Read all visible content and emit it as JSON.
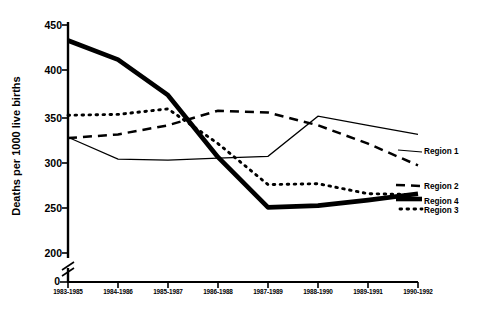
{
  "chart_data": {
    "type": "line",
    "title": "",
    "xlabel": "",
    "ylabel": "Deaths per 1000 live births",
    "categories": [
      "1983-1985",
      "1984-1986",
      "1985-1987",
      "1986-1988",
      "1987-1989",
      "1988-1990",
      "1989-1991",
      "1990-1992"
    ],
    "yticks": [
      200,
      250,
      300,
      350,
      400,
      450
    ],
    "ylim": [
      200,
      450
    ],
    "y_axis_break": true,
    "y_axis_origin_label": "0",
    "grid": false,
    "legend_position": "right",
    "series": [
      {
        "name": "Region 1",
        "style": "thin-solid",
        "values": [
          327,
          303,
          302,
          304,
          306,
          350,
          340,
          330
        ]
      },
      {
        "name": "Region 2",
        "style": "dashed",
        "values": [
          326,
          330,
          340,
          356,
          354,
          340,
          320,
          296
        ]
      },
      {
        "name": "Region 3",
        "style": "dotted",
        "values": [
          351,
          352,
          358,
          320,
          275,
          276,
          265,
          264
        ]
      },
      {
        "name": "Region 4",
        "style": "thick-solid",
        "values": [
          433,
          412,
          373,
          305,
          250,
          252,
          258,
          265
        ]
      }
    ]
  },
  "axis": {
    "ytick_labels": [
      "450",
      "400",
      "350",
      "300",
      "250",
      "200"
    ],
    "origin_label": "0",
    "y_title": "Deaths per 1000 live births"
  },
  "legend": {
    "items": [
      {
        "label": "Region 1"
      },
      {
        "label": "Region 2"
      },
      {
        "label": "Region 4"
      },
      {
        "label": "Region 3"
      }
    ]
  }
}
